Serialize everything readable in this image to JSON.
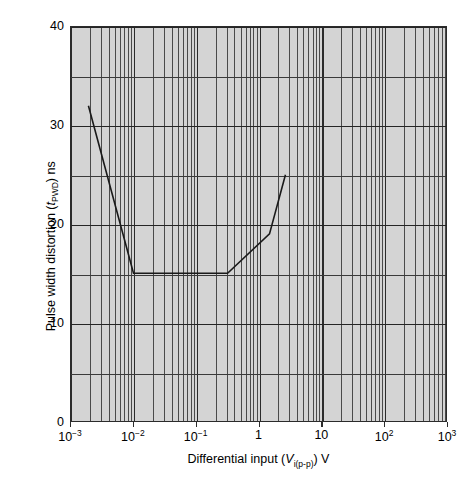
{
  "chart_data": {
    "type": "line",
    "title": "",
    "xlabel_parts": {
      "pre": "Differential input (",
      "var": "V",
      "sub": "i(p-p)",
      "post": ") V"
    },
    "ylabel_parts": {
      "pre": "Pulse width distortion (",
      "var": "t",
      "sub": "PWD",
      "post": ") ns"
    },
    "xlabel": "Differential input (Vi(p-p)) V",
    "ylabel": "Pulse width distortion (tPWD) ns",
    "xscale": "log",
    "yscale": "linear",
    "xlim": [
      0.001,
      1000
    ],
    "ylim": [
      0,
      40
    ],
    "grid": true,
    "legend": "none",
    "x_tick_labels": [
      "10⁻³",
      "10⁻²",
      "10⁻¹",
      "1",
      "10",
      "10²",
      "10³"
    ],
    "x_tick_mantissa": [
      "10",
      "10",
      "10",
      "1",
      "10",
      "10",
      "10"
    ],
    "x_tick_exponent": [
      "-3",
      "-2",
      "-1",
      "",
      "",
      "2",
      "3"
    ],
    "x_tick_values": [
      0.001,
      0.01,
      0.1,
      1,
      10,
      100,
      1000
    ],
    "y_tick_labels": [
      "0",
      "10",
      "20",
      "30",
      "40"
    ],
    "y_tick_values": [
      0,
      10,
      20,
      30,
      40
    ],
    "y_minor_values": [
      5,
      15,
      25,
      35
    ],
    "series": [
      {
        "name": "Pulse width distortion",
        "x": [
          0.0019,
          0.01,
          0.32,
          1.5,
          2.7
        ],
        "y": [
          32,
          15,
          15,
          19,
          25
        ]
      }
    ],
    "colors": {
      "plot_background": "#d4d4d4",
      "page_background": "#ffffff",
      "gridline": "#4a4a4a",
      "gridline_major": "#2b2b2b",
      "curve": "#1a1a1a",
      "text": "#000000"
    }
  }
}
